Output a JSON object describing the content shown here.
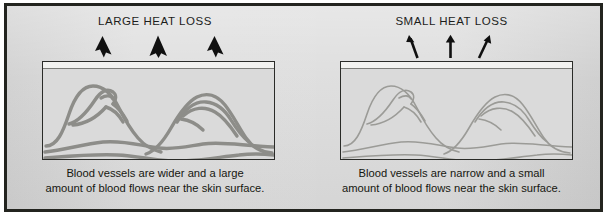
{
  "figure": {
    "frame_color": "#23241f",
    "background_color": "#d9d9d9",
    "vessel_color_wide": "#8a8a86",
    "vessel_color_narrow": "#9a9a96"
  },
  "panels": [
    {
      "id": "large-heat-loss",
      "heading": "LARGE HEAT LOSS",
      "arrow_style": "thick-solid-arrowhead",
      "arrow_count": 3,
      "caption_line1": "Blood vessels are wider and a large",
      "caption_line2": "amount of blood flows near the skin surface."
    },
    {
      "id": "small-heat-loss",
      "heading": "SMALL HEAT LOSS",
      "arrow_style": "thin-line-arrow",
      "arrow_count": 3,
      "caption_line1": "Blood vessels are narrow and a small",
      "caption_line2": "amount of blood flows near the skin surface."
    }
  ]
}
